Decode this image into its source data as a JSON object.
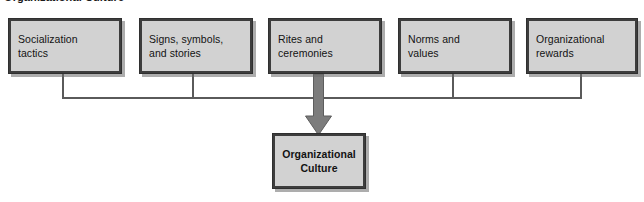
{
  "figure": {
    "title": "Organizational Culture",
    "colors": {
      "box_fill": "#d2d2d2",
      "box_border": "#3d3d3d",
      "connector": "#5a5a5a",
      "arrow": "#7c7c7c",
      "canvas": "#ffffff",
      "text": "#131313"
    }
  },
  "diagram": {
    "type": "flow-diagram",
    "orientation": "top-down",
    "factors": [
      {
        "id": "socialization-tactics",
        "label": "Socialization\ntactics"
      },
      {
        "id": "signs-symbols-stories",
        "label": "Signs, symbols,\nand stories"
      },
      {
        "id": "rites-and-ceremonies",
        "label": "Rites and\nceremonies"
      },
      {
        "id": "norms-and-values",
        "label": "Norms and\nvalues"
      },
      {
        "id": "organizational-rewards",
        "label": "Organizational\nrewards"
      }
    ],
    "outcome": {
      "id": "organizational-culture",
      "label": "Organizational\nCulture"
    },
    "connector_note": "All five factor boxes drop into a shared horizontal bus that feeds a single thick downward arrow into the outcome box."
  }
}
